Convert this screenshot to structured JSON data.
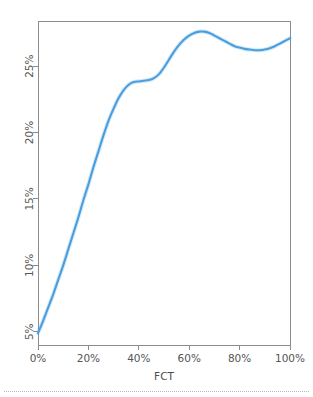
{
  "chart_data": {
    "type": "line",
    "title": "",
    "subtitle": "",
    "xlabel": "FCT",
    "ylabel": "",
    "xlim": [
      0,
      100
    ],
    "ylim": [
      4.0,
      28.4
    ],
    "grid": false,
    "legend": null,
    "line_color": "#4a9ede",
    "xticks": [
      "0%",
      "20%",
      "40%",
      "60%",
      "80%",
      "100%"
    ],
    "xtick_values": [
      0,
      20,
      40,
      60,
      80,
      100
    ],
    "yticks": [
      "5%",
      "10%",
      "15%",
      "20%",
      "25%"
    ],
    "ytick_values": [
      5,
      10,
      15,
      20,
      25
    ],
    "series": [
      {
        "name": "FCT curve",
        "x": [
          0,
          2,
          4,
          6,
          8,
          10,
          12,
          14,
          16,
          18,
          20,
          22,
          24,
          26,
          28,
          30,
          32,
          34,
          36,
          38,
          40,
          42,
          44,
          46,
          48,
          50,
          52,
          54,
          56,
          58,
          60,
          62,
          64,
          66,
          68,
          70,
          72,
          74,
          76,
          78,
          80,
          82,
          84,
          86,
          88,
          90,
          92,
          94,
          96,
          98,
          100
        ],
        "values": [
          4.9,
          5.8,
          6.8,
          7.8,
          8.9,
          10.0,
          11.2,
          12.4,
          13.6,
          14.9,
          16.1,
          17.4,
          18.6,
          19.8,
          20.9,
          21.8,
          22.6,
          23.2,
          23.6,
          23.8,
          23.85,
          23.9,
          23.95,
          24.1,
          24.4,
          24.9,
          25.5,
          26.1,
          26.6,
          27.0,
          27.3,
          27.5,
          27.6,
          27.6,
          27.5,
          27.3,
          27.1,
          26.9,
          26.7,
          26.5,
          26.4,
          26.3,
          26.25,
          26.2,
          26.2,
          26.25,
          26.35,
          26.5,
          26.7,
          26.9,
          27.1
        ]
      }
    ],
    "annotations": []
  },
  "axes": {
    "x_axis_title": "FCT"
  },
  "colors": {
    "line": "#4a9ede",
    "axis": "#8c8c8c",
    "text": "#555555",
    "background": "#ffffff",
    "footer_rule": "#b9b9b9"
  }
}
